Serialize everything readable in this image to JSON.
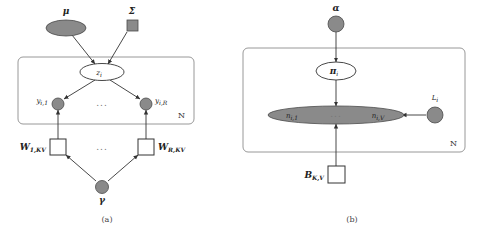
{
  "figure": {
    "panels": [
      {
        "id": "a",
        "caption": "(a)",
        "plate_label": "N",
        "ellipsis": "...",
        "nodes": {
          "mu": "μ",
          "sigma": "Σ",
          "z": "z",
          "z_sub": "i",
          "y_left": "y",
          "y_left_sub": "i,1",
          "y_right": "y",
          "y_right_sub": "i,R",
          "w_left": "W",
          "w_left_sub": "1,KV",
          "w_right": "W",
          "w_right_sub": "R,KV",
          "gamma": "γ"
        }
      },
      {
        "id": "b",
        "caption": "(b)",
        "plate_label": "N",
        "ellipsis": "...",
        "nodes": {
          "alpha": "α",
          "pi": "π",
          "pi_sub": "i",
          "n_left": "n",
          "n_left_sub": "i,1",
          "n_right": "n",
          "n_right_sub": "i,V",
          "L": "L",
          "L_sub": "i",
          "B": "B",
          "B_sub": "K,V"
        }
      }
    ]
  },
  "colors": {
    "observed_fill": "#8a8a8a",
    "observed_stroke": "#4a4a4a",
    "latent_fill": "#ffffff",
    "latent_stroke": "#333333",
    "plate_stroke": "#8c8c8c",
    "edge": "#333333",
    "background": "#ffffff"
  }
}
